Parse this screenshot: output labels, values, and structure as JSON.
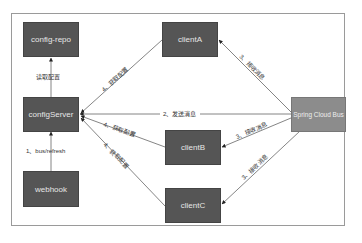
{
  "nodes": {
    "config_repo": "config-repo",
    "client_a": "clientA",
    "config_server": "configServer",
    "spring_cloud_bus": "Spring Cloud Bus",
    "client_b": "clientB",
    "webhook": "webhook",
    "client_c": "clientC"
  },
  "edges": {
    "read_config": "读取配置",
    "bus_refresh": "1、bus/refresh",
    "send_message": "2、发送消息",
    "receive_a": "3、接收消息",
    "receive_b": "3、接收消息",
    "receive_c": "3、接收消息",
    "fetch_a": "4、获取配置",
    "fetch_b": "4、获取配置",
    "fetch_c": "4、获取配置"
  },
  "colors": {
    "node_dark": "#555555",
    "node_bus": "#8c8c8c",
    "edge": "#555555"
  }
}
